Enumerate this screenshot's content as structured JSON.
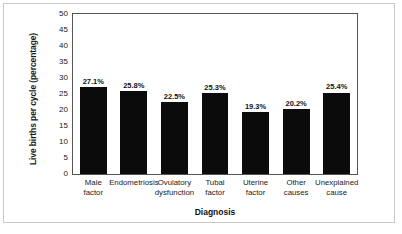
{
  "chart_data": {
    "type": "bar",
    "title": "",
    "xlabel": "Diagnosis",
    "ylabel": "Live births per cycle (percentage)",
    "categories": [
      "Male factor",
      "Endometriosis",
      "Ovulatory dysfunction",
      "Tubal factor",
      "Uterine factor",
      "Other causes",
      "Unexplained cause"
    ],
    "category_lines": [
      [
        "Male",
        "factor"
      ],
      [
        "Endometriosis",
        ""
      ],
      [
        "Ovulatory",
        "dysfunction"
      ],
      [
        "Tubal",
        "factor"
      ],
      [
        "Uterine",
        "factor"
      ],
      [
        "Other",
        "causes"
      ],
      [
        "Unexplained",
        "cause"
      ]
    ],
    "values": [
      27.1,
      25.8,
      22.5,
      25.3,
      19.3,
      20.2,
      25.4
    ],
    "value_labels": [
      "27.1%",
      "25.8%",
      "22.5%",
      "25.3%",
      "19.3%",
      "20.2%",
      "25.4%"
    ],
    "ylim": [
      0,
      50
    ],
    "ytick_labels": [
      "50",
      "45",
      "40",
      "35",
      "30",
      "25",
      "20",
      "15",
      "10",
      "5",
      "0"
    ],
    "ytick_values": [
      50,
      45,
      40,
      35,
      30,
      25,
      20,
      15,
      10,
      5,
      0
    ],
    "ytick_step": 5,
    "grid": false,
    "legend": null,
    "bar_color": "#0b0b0b",
    "frame_color": "#555555",
    "text_color": "#1a1a1a"
  }
}
